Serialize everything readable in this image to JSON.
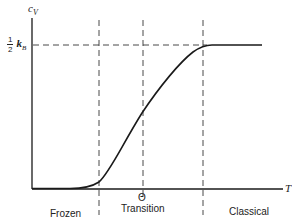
{
  "diagram": {
    "y_axis_label": "c",
    "y_axis_subscript": "V",
    "x_axis_label": "T",
    "plateau_label": {
      "numerator": "1",
      "denominator": "2",
      "symbol": "k",
      "subscript": "B"
    },
    "theta_label": "Θ",
    "regions": [
      {
        "label": "Frozen"
      },
      {
        "label": "Transition"
      },
      {
        "label": "Classical"
      }
    ],
    "colors": {
      "line": "#1a1a1a",
      "background": "#ffffff"
    }
  }
}
